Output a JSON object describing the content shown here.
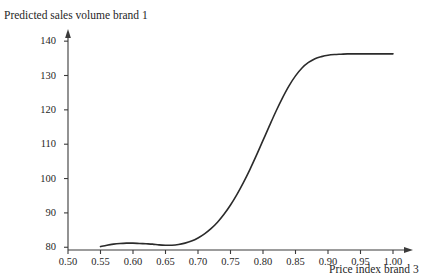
{
  "figure": {
    "y_axis_title": "Predicted sales volume brand 1",
    "x_axis_title": "Price index brand 3",
    "axis_color": "#3a3a3a",
    "curve_color": "#2b2b2b",
    "background": "#ffffff"
  },
  "chart_data": {
    "type": "line",
    "title": "",
    "subtitle": "",
    "xlabel": "Price index brand 3",
    "ylabel": "Predicted sales volume brand 1",
    "xlim": [
      0.5,
      1.02
    ],
    "ylim": [
      79.2,
      141.5
    ],
    "xticks": [
      0.5,
      0.55,
      0.6,
      0.65,
      0.7,
      0.75,
      0.8,
      0.85,
      0.9,
      0.95,
      1.0
    ],
    "xtick_labels": [
      "0.50",
      "0.55",
      "0.60",
      "0.65",
      "0.70",
      "0.75",
      "0.80",
      "0.85",
      "0.90",
      "0.95",
      "1.00"
    ],
    "yticks": [
      80,
      90,
      100,
      110,
      120,
      130,
      140
    ],
    "ytick_labels": [
      "80",
      "90",
      "100",
      "110",
      "120",
      "130",
      "140"
    ],
    "grid": false,
    "legend": null,
    "annotations": [],
    "series": [
      {
        "name": "Predicted sales volume brand 1",
        "color": "#2b2b2b",
        "line_width": 1.6,
        "x": [
          0.55,
          0.56,
          0.57,
          0.58,
          0.59,
          0.6,
          0.61,
          0.62,
          0.63,
          0.64,
          0.65,
          0.66,
          0.67,
          0.68,
          0.69,
          0.7,
          0.71,
          0.72,
          0.73,
          0.74,
          0.75,
          0.76,
          0.77,
          0.78,
          0.79,
          0.8,
          0.81,
          0.82,
          0.83,
          0.84,
          0.85,
          0.86,
          0.87,
          0.88,
          0.89,
          0.9,
          0.91,
          0.92,
          0.93,
          0.94,
          0.95,
          0.96,
          0.97,
          0.98,
          0.99,
          1.0
        ],
        "y": [
          80.2,
          80.6,
          80.9,
          81.1,
          81.2,
          81.2,
          81.1,
          81.0,
          80.9,
          80.7,
          80.6,
          80.6,
          80.8,
          81.2,
          81.8,
          82.7,
          83.9,
          85.4,
          87.3,
          89.6,
          92.3,
          95.4,
          98.9,
          102.7,
          106.8,
          111.1,
          115.4,
          119.6,
          123.5,
          127.0,
          129.9,
          132.2,
          133.8,
          134.9,
          135.5,
          135.9,
          136.1,
          136.2,
          136.3,
          136.3,
          136.3,
          136.3,
          136.3,
          136.3,
          136.3,
          136.3
        ]
      }
    ]
  },
  "axes": {
    "x_tick_values": [
      "0.50",
      "0.55",
      "0.60",
      "0.65",
      "0.70",
      "0.75",
      "0.80",
      "0.85",
      "0.90",
      "0.95",
      "1.00"
    ],
    "y_tick_values": [
      "140",
      "130",
      "120",
      "110",
      "100",
      "90",
      "80"
    ]
  }
}
